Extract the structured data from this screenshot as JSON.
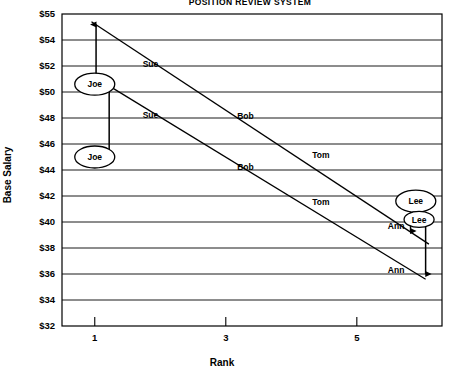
{
  "chart_data": {
    "type": "line",
    "title": "POSITION REVIEW SYSTEM",
    "xlabel": "Rank",
    "ylabel": "Base Salary",
    "xlim": [
      0.5,
      6.3
    ],
    "ylim": [
      32,
      55
    ],
    "grid": true,
    "legend": "none",
    "x_ticks": [
      "1",
      "3",
      "5"
    ],
    "x_tick_values": [
      1,
      3,
      5
    ],
    "y_ticks": [
      "$55",
      "$54",
      "$52",
      "$50",
      "$48",
      "$46",
      "$44",
      "$42",
      "$40",
      "$38",
      "$36",
      "$34",
      "$32"
    ],
    "y_tick_values": [
      55,
      54,
      52,
      50,
      48,
      46,
      44,
      42,
      40,
      38,
      36,
      34,
      32
    ],
    "series": [
      {
        "name": "upper-line",
        "x": [
          0.95,
          6.1
        ],
        "values": [
          54.7,
          38.3
        ],
        "point_labels": [
          "Sue",
          "Bob",
          "Tom",
          "Ann"
        ],
        "points": [
          {
            "label": "Sue",
            "x": 1.85,
            "y": 51.9
          },
          {
            "label": "Bob",
            "x": 3.3,
            "y": 47.9
          },
          {
            "label": "Tom",
            "x": 4.45,
            "y": 44.9
          },
          {
            "label": "Ann",
            "x": 5.6,
            "y": 39.5
          }
        ]
      },
      {
        "name": "lower-line",
        "x": [
          0.95,
          6.05
        ],
        "values": [
          51.3,
          35.6
        ],
        "point_labels": [
          "Sue",
          "Bob",
          "Tom",
          "Ann"
        ],
        "points": [
          {
            "label": "Sue",
            "x": 1.85,
            "y": 48.0
          },
          {
            "label": "Bob",
            "x": 3.3,
            "y": 44.0
          },
          {
            "label": "Tom",
            "x": 4.45,
            "y": 41.3
          },
          {
            "label": "Ann",
            "x": 5.6,
            "y": 36.1
          }
        ]
      }
    ],
    "callouts": [
      {
        "name": "joe-upper",
        "label": "Joe",
        "x": 1.0,
        "y": 50.6,
        "side": "left"
      },
      {
        "name": "joe-lower",
        "label": "Joe",
        "x": 1.0,
        "y": 45.0,
        "side": "left"
      },
      {
        "name": "lee-upper",
        "label": "Lee",
        "x": 5.9,
        "y": 41.6,
        "side": "right"
      },
      {
        "name": "lee-lower",
        "label": "Lee",
        "x": 5.95,
        "y": 40.2,
        "side": "right"
      }
    ],
    "gap_arrows": [
      {
        "name": "joe-upper-gap",
        "x": 1.02,
        "y_top": 54.6,
        "y_bottom": 51.0
      },
      {
        "name": "joe-lower-gap",
        "x": 1.22,
        "y_top": 50.4,
        "y_bottom": 45.1
      },
      {
        "name": "lee-upper-gap",
        "x": 5.82,
        "y_top": 41.4,
        "y_bottom": 39.3
      },
      {
        "name": "lee-lower-gap",
        "x": 6.05,
        "y_top": 40.1,
        "y_bottom": 36.0
      }
    ]
  }
}
